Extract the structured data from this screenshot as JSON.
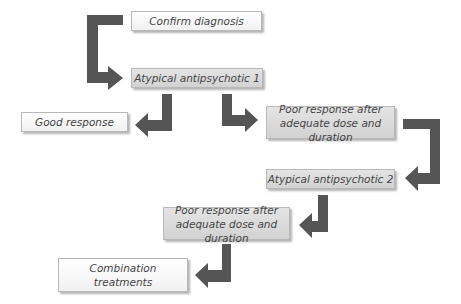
{
  "diagram": {
    "type": "flowchart",
    "colors": {
      "arrow": "#555555",
      "light_box": "#f6f6f6",
      "grey_box": "#d9d9d9",
      "text": "#444444"
    },
    "nodes": [
      {
        "id": "confirm",
        "label": "Confirm diagnosis",
        "style": "light"
      },
      {
        "id": "aa1",
        "label": "Atypical antipsychotic 1",
        "style": "grey"
      },
      {
        "id": "good",
        "label": "Good response",
        "style": "light"
      },
      {
        "id": "poor1",
        "label": "Poor response after adequate dose and duration",
        "style": "grey"
      },
      {
        "id": "aa2",
        "label": "Atypical antipsychotic 2",
        "style": "grey"
      },
      {
        "id": "poor2",
        "label": "Poor response after adequate dose and duration",
        "style": "grey"
      },
      {
        "id": "combo",
        "label": "Combination treatments",
        "style": "light"
      }
    ],
    "edges": [
      {
        "from": "confirm",
        "to": "aa1"
      },
      {
        "from": "aa1",
        "to": "good"
      },
      {
        "from": "aa1",
        "to": "poor1"
      },
      {
        "from": "poor1",
        "to": "aa2"
      },
      {
        "from": "aa2",
        "to": "poor2"
      },
      {
        "from": "poor2",
        "to": "combo"
      }
    ]
  }
}
